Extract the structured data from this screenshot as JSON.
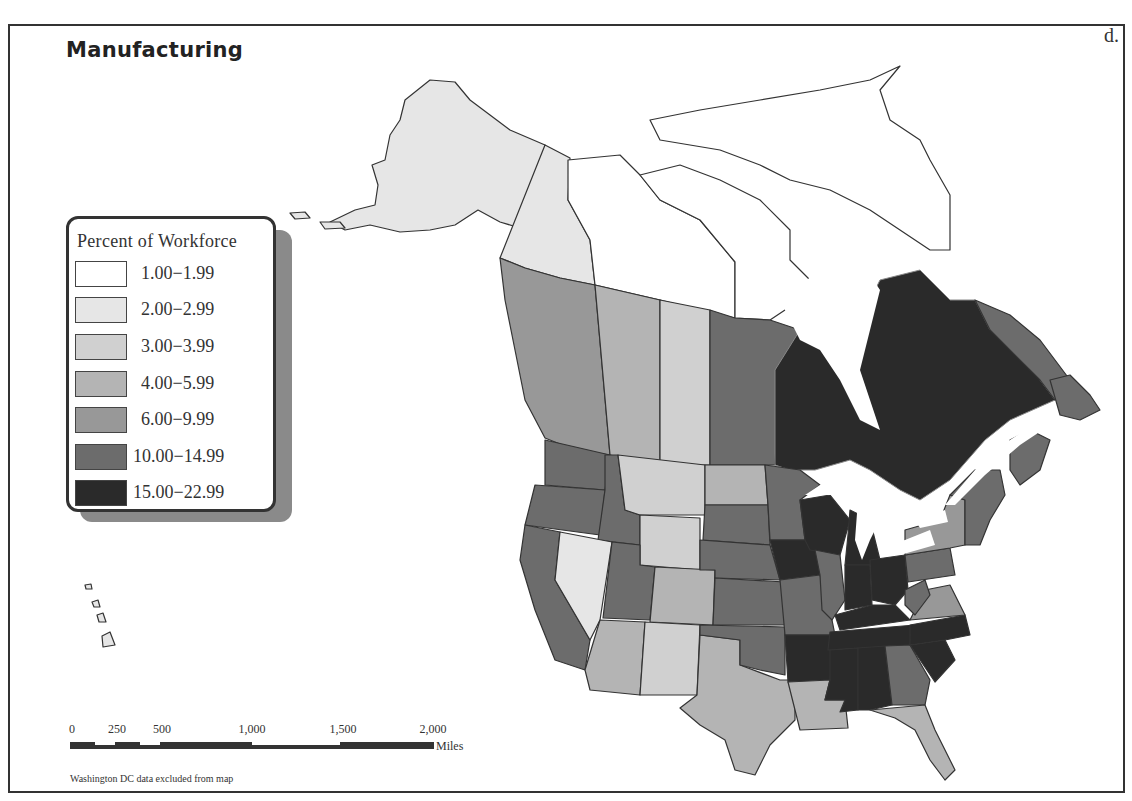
{
  "map": {
    "title": "Manufacturing",
    "panel_letter": "d.",
    "note": "Washington DC data excluded from map",
    "legend": {
      "title": "Percent of Workforce",
      "classes": [
        {
          "label": "1.00−1.99",
          "color": "#ffffff"
        },
        {
          "label": "2.00−2.99",
          "color": "#e6e6e6"
        },
        {
          "label": "3.00−3.99",
          "color": "#d0d0d0"
        },
        {
          "label": "4.00−5.99",
          "color": "#b4b4b4"
        },
        {
          "label": "6.00−9.99",
          "color": "#989898"
        },
        {
          "label": "10.00−14.99",
          "color": "#6c6c6c"
        },
        {
          "label": "15.00−22.99",
          "color": "#2a2a2a"
        }
      ]
    },
    "scale_bar": {
      "ticks": [
        "0",
        "250",
        "500",
        "1,000",
        "1,500",
        "2,000"
      ],
      "units": "Miles"
    },
    "regions": {
      "alaska": "2.00-2.99 (3.00-3.99 shade)",
      "yukon": "2.00-2.99",
      "northwest_territories": "1.00-1.99",
      "nunavut": "1.00-1.99",
      "british_columbia": "6.00-9.99",
      "alberta": "4.00-5.99",
      "saskatchewan": "3.00-3.99",
      "manitoba": "10.00-14.99",
      "ontario": "15.00-22.99",
      "quebec": "15.00-22.99",
      "newfoundland_labrador": "10.00-14.99",
      "maritimes": "10.00-14.99",
      "washington": "10.00-14.99",
      "oregon": "10.00-14.99",
      "california": "10.00-14.99",
      "idaho": "10.00-14.99",
      "nevada": "2.00-2.99",
      "montana": "3.00-3.99",
      "wyoming": "3.00-3.99",
      "utah": "10.00-14.99",
      "colorado": "4.00-5.99",
      "arizona": "4.00-5.99",
      "new_mexico": "3.00-3.99",
      "texas": "4.00-5.99",
      "north_dakota": "4.00-5.99",
      "south_dakota": "10.00-14.99",
      "nebraska": "10.00-14.99",
      "kansas": "10.00-14.99",
      "oklahoma": "10.00-14.99",
      "minnesota": "10.00-14.99",
      "iowa": "15.00-22.99",
      "missouri": "10.00-14.99",
      "arkansas": "15.00-22.99",
      "louisiana": "4.00-5.99",
      "wisconsin": "15.00-22.99",
      "illinois": "10.00-14.99",
      "michigan": "15.00-22.99",
      "indiana": "15.00-22.99",
      "ohio": "15.00-22.99",
      "kentucky": "15.00-22.99",
      "tennessee": "15.00-22.99",
      "mississippi": "15.00-22.99",
      "alabama": "15.00-22.99",
      "georgia": "10.00-14.99",
      "florida": "4.00-5.99",
      "south_carolina": "15.00-22.99",
      "north_carolina": "15.00-22.99",
      "virginia": "6.00-9.99",
      "west_virginia": "10.00-14.99",
      "pennsylvania": "10.00-14.99",
      "new_york": "6.00-9.99",
      "new_england": "10.00-14.99",
      "hawaii": "2.00-2.99"
    }
  }
}
